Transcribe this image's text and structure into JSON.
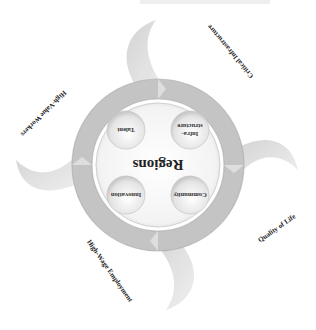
{
  "diagram": {
    "orientation": "rotated 180 degrees",
    "center": {
      "label": "Regions"
    },
    "inner_nodes": [
      {
        "id": "infrastructure",
        "label_line1": "Infra-",
        "label_line2": "structure"
      },
      {
        "id": "talent",
        "label_line1": "Talent",
        "label_line2": ""
      },
      {
        "id": "innovation",
        "label_line1": "Innovation",
        "label_line2": ""
      },
      {
        "id": "community",
        "label_line1": "Community",
        "label_line2": ""
      }
    ],
    "outer_labels": [
      {
        "id": "critical-infrastructure",
        "label": "Critical Infrastructure"
      },
      {
        "id": "high-value-workers",
        "label": "High-Value Workers"
      },
      {
        "id": "quality-of-life",
        "label": "Quality of Life"
      },
      {
        "id": "high-wage-employment",
        "label": "High-Wage Employment"
      }
    ],
    "colors": {
      "ring": "#bdbdbd",
      "ring_dark": "#9a9a9a",
      "swoosh": "#d8d8d8",
      "center_fill": "#f7f7f7",
      "node_fill": "#e6e6e6",
      "text": "#222222"
    }
  }
}
